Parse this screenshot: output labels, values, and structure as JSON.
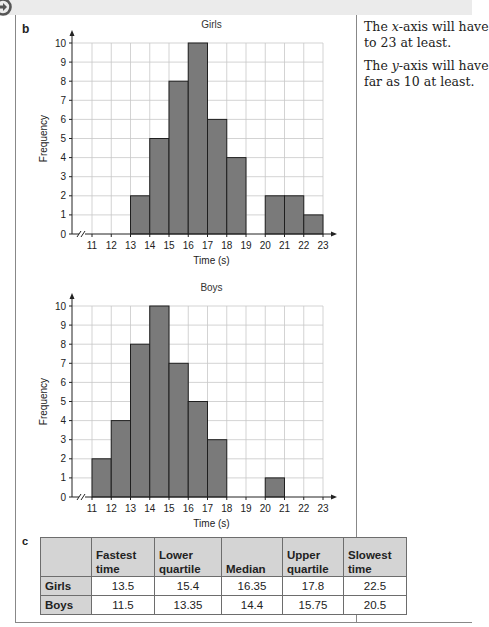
{
  "page": {
    "part_b_label": "b",
    "part_c_label": "c",
    "side_notes": [
      "The x-axis will have",
      "to 23 at least.",
      "The y-axis will have",
      "far as 10 at least."
    ]
  },
  "chart_data": [
    {
      "type": "bar",
      "title": "Girls",
      "xlabel": "Time (s)",
      "ylabel": "Frequency",
      "categories": [
        "11-12",
        "12-13",
        "13-14",
        "14-15",
        "15-16",
        "16-17",
        "17-18",
        "18-19",
        "19-20",
        "20-21",
        "21-22",
        "22-23"
      ],
      "bin_edges": [
        11,
        12,
        13,
        14,
        15,
        16,
        17,
        18,
        19,
        20,
        21,
        22,
        23
      ],
      "values": [
        0,
        0,
        2,
        5,
        8,
        10,
        6,
        4,
        0,
        2,
        2,
        1
      ],
      "x_ticks": [
        11,
        12,
        13,
        14,
        15,
        16,
        17,
        18,
        19,
        20,
        21,
        22,
        23
      ],
      "y_ticks": [
        0,
        1,
        2,
        3,
        4,
        5,
        6,
        7,
        8,
        9,
        10
      ],
      "xlim": [
        11,
        23
      ],
      "ylim": [
        0,
        10
      ],
      "grid": true,
      "axis_break": true,
      "bar_color": "#7a7a7a"
    },
    {
      "type": "bar",
      "title": "Boys",
      "xlabel": "Time (s)",
      "ylabel": "Frequency",
      "categories": [
        "11-12",
        "12-13",
        "13-14",
        "14-15",
        "15-16",
        "16-17",
        "17-18",
        "18-19",
        "19-20",
        "20-21",
        "21-22",
        "22-23"
      ],
      "bin_edges": [
        11,
        12,
        13,
        14,
        15,
        16,
        17,
        18,
        19,
        20,
        21,
        22,
        23
      ],
      "values": [
        2,
        4,
        8,
        10,
        7,
        5,
        3,
        0,
        0,
        1,
        0,
        0
      ],
      "x_ticks": [
        11,
        12,
        13,
        14,
        15,
        16,
        17,
        18,
        19,
        20,
        21,
        22,
        23
      ],
      "y_ticks": [
        0,
        1,
        2,
        3,
        4,
        5,
        6,
        7,
        8,
        9,
        10
      ],
      "xlim": [
        11,
        23
      ],
      "ylim": [
        0,
        10
      ],
      "grid": true,
      "axis_break": true,
      "bar_color": "#7a7a7a"
    }
  ],
  "table": {
    "headers": [
      "",
      "Fastest time",
      "Lower quartile",
      "Median",
      "Upper quartile",
      "Slowest time"
    ],
    "header_lines": [
      [
        "",
        ""
      ],
      [
        "Fastest",
        "time"
      ],
      [
        "Lower",
        "quartile"
      ],
      [
        "",
        "Median"
      ],
      [
        "Upper",
        "quartile"
      ],
      [
        "Slowest",
        "time"
      ]
    ],
    "rows": [
      {
        "label": "Girls",
        "values": [
          "13.5",
          "15.4",
          "16.35",
          "17.8",
          "22.5"
        ]
      },
      {
        "label": "Boys",
        "values": [
          "11.5",
          "13.35",
          "14.4",
          "15.75",
          "20.5"
        ]
      }
    ]
  },
  "icons": {
    "top_left": "next-arrow-circle-icon"
  }
}
